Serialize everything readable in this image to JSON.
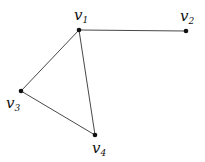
{
  "graph": {
    "nodes": [
      {
        "id": "v1",
        "label": "v",
        "subscript": "1"
      },
      {
        "id": "v2",
        "label": "v",
        "subscript": "2"
      },
      {
        "id": "v3",
        "label": "v",
        "subscript": "3"
      },
      {
        "id": "v4",
        "label": "v",
        "subscript": "4"
      }
    ],
    "edges": [
      {
        "from": "v1",
        "to": "v2"
      },
      {
        "from": "v1",
        "to": "v3"
      },
      {
        "from": "v1",
        "to": "v4"
      },
      {
        "from": "v3",
        "to": "v4"
      }
    ]
  }
}
